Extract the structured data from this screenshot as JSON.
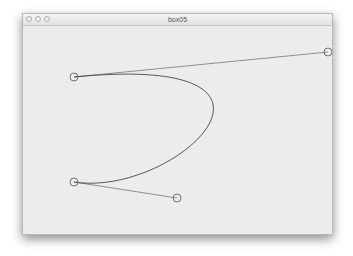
{
  "window": {
    "title": "box05",
    "controls": [
      "close",
      "minimize",
      "zoom"
    ]
  },
  "sketch": {
    "stroke_color": "#555555",
    "background_color": "#ececec",
    "anchors": [
      {
        "name": "anchor-1",
        "x": 74,
        "y": 77
      },
      {
        "name": "anchor-2",
        "x": 74,
        "y": 182
      }
    ],
    "control_points": [
      {
        "name": "control-1",
        "x": 328,
        "y": 52
      },
      {
        "name": "control-2",
        "x": 177,
        "y": 198
      }
    ]
  }
}
